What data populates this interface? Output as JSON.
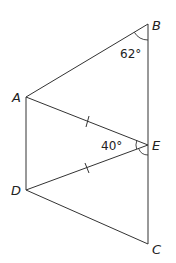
{
  "diagram": {
    "points": {
      "A": {
        "label": "A",
        "x": 26,
        "y": 97
      },
      "B": {
        "label": "B",
        "x": 148,
        "y": 24
      },
      "C": {
        "label": "C",
        "x": 148,
        "y": 244
      },
      "D": {
        "label": "D",
        "x": 26,
        "y": 190
      },
      "E": {
        "label": "E",
        "x": 148,
        "y": 145
      }
    },
    "segments": [
      "AB",
      "BE",
      "EC",
      "AE",
      "DE",
      "AD",
      "DC"
    ],
    "equal_marks": [
      "AE",
      "DE"
    ],
    "angles": {
      "B": {
        "label": "62°",
        "vertex": "B"
      },
      "AED": {
        "label": "40°",
        "vertex": "E"
      }
    },
    "colors": {
      "line": "#333333",
      "text": "#222222",
      "background": "#ffffff"
    }
  }
}
